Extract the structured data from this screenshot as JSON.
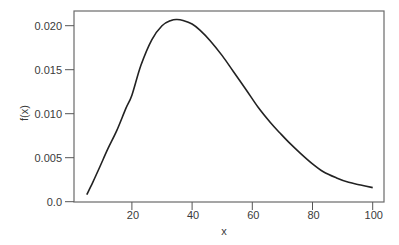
{
  "chart_data": {
    "type": "line",
    "title": "",
    "xlabel": "x",
    "ylabel": "f(x)",
    "xlim": [
      1.2,
      104
    ],
    "ylim": [
      0.0,
      0.0216
    ],
    "grid": false,
    "legend": null,
    "x_ticks": [
      20,
      40,
      60,
      80,
      100
    ],
    "x_tick_labels": [
      "20",
      "40",
      "60",
      "80",
      "100"
    ],
    "y_ticks": [
      0.0,
      0.005,
      0.01,
      0.015,
      0.02
    ],
    "y_tick_labels": [
      "0.0",
      "0.005",
      "0.010",
      "0.015",
      "0.020"
    ],
    "series": [
      {
        "name": "f(x)",
        "color": "#222222",
        "x": [
          5,
          7,
          9.4,
          12,
          15,
          18,
          20,
          23,
          26.6,
          30,
          33,
          35,
          37,
          40,
          42.6,
          46,
          50,
          53.7,
          58,
          62,
          66,
          69.2,
          72,
          76,
          80,
          83.6,
          88,
          92,
          96,
          100
        ],
        "y": [
          0.0008,
          0.0022,
          0.004,
          0.006,
          0.0081,
          0.0106,
          0.0121,
          0.0155,
          0.0184,
          0.02,
          0.0206,
          0.0207,
          0.0206,
          0.0202,
          0.0195,
          0.0183,
          0.0166,
          0.0148,
          0.0127,
          0.0107,
          0.009,
          0.0078,
          0.0068,
          0.0055,
          0.0043,
          0.0034,
          0.0027,
          0.0022,
          0.0019,
          0.0016
        ]
      }
    ]
  }
}
